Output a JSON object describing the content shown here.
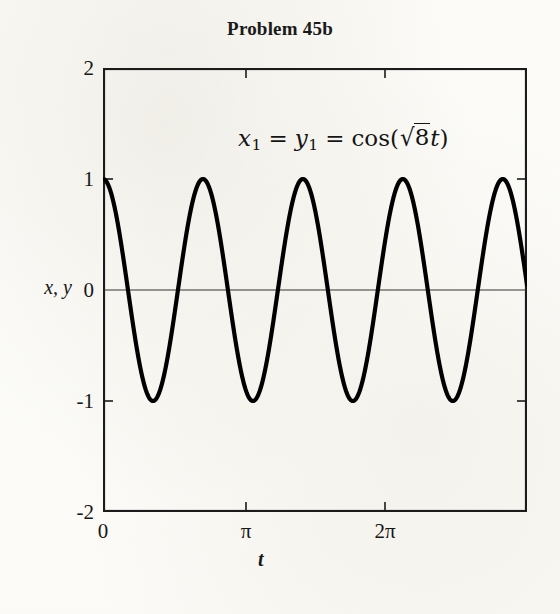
{
  "figure": {
    "title": "Problem 45b"
  },
  "annotation": {
    "lhs_var": "x",
    "lhs_sub": "1",
    "eq1": "=",
    "mid_var": "y",
    "mid_sub": "1",
    "eq2": "=",
    "func": "cos(",
    "radical": "√",
    "radicand": "8",
    "arg_var": "t",
    "close": ")",
    "full_text": "x₁ = y₁ = cos(√8t)"
  },
  "axes": {
    "ylabel": "x, y",
    "xlabel": "t",
    "yticks": [
      "2",
      "1",
      "0",
      "-1",
      "-2"
    ],
    "xticks": [
      "0",
      "π",
      "2π"
    ]
  },
  "chart_data": {
    "type": "line",
    "title": "Problem 45b",
    "xlabel": "t",
    "ylabel": "x, y",
    "xlim": [
      0,
      9.4248
    ],
    "ylim": [
      -2,
      2
    ],
    "xticks": [
      0,
      3.14159,
      6.28319
    ],
    "xticklabels": [
      "0",
      "π",
      "2π"
    ],
    "yticks": [
      -2,
      -1,
      0,
      1,
      2
    ],
    "yticklabels": [
      "-2",
      "-1",
      "0",
      "1",
      "2"
    ],
    "grid": false,
    "legend": null,
    "annotations": [
      {
        "text": "x_1 = y_1 = cos(sqrt(8) t)",
        "x": 4.2,
        "y": 1.45
      }
    ],
    "series": [
      {
        "name": "x1 = y1 = cos(sqrt(8) t)",
        "formula": "cos(2.8284271247461903 * t)",
        "color": "#000000",
        "linewidth": 4.2,
        "period": 2.221441469079183,
        "amplitude": 1,
        "x": [
          0,
          0.1924,
          0.3848,
          0.5772,
          0.7696,
          0.962,
          1.1544,
          1.3468,
          1.5392,
          1.7316,
          1.924,
          2.1164,
          2.3088,
          2.5012,
          2.6936,
          2.886,
          3.0784,
          3.2708,
          3.4632,
          3.6556,
          3.848,
          4.0404,
          4.2328,
          4.4252,
          4.6176,
          4.81,
          5.0024,
          5.1948,
          5.3872,
          5.5796,
          5.772,
          5.9644,
          6.1568,
          6.3492,
          6.5416,
          6.734,
          6.9264,
          7.1188,
          7.3112,
          7.5036,
          7.696,
          7.8884,
          8.0808,
          8.2732,
          8.4656,
          8.658,
          8.8504,
          9.0428,
          9.2352,
          9.4248
        ],
        "y": [
          1.0,
          0.853,
          0.455,
          -0.071,
          -0.568,
          -0.894,
          -0.97,
          -0.777,
          -0.368,
          0.142,
          0.617,
          0.919,
          0.96,
          0.743,
          0.315,
          -0.199,
          -0.663,
          -0.94,
          -0.949,
          -0.705,
          -0.261,
          0.254,
          0.705,
          0.957,
          0.935,
          0.663,
          0.206,
          -0.309,
          -0.743,
          -0.968,
          -0.918,
          -0.617,
          -0.149,
          0.364,
          0.777,
          0.975,
          0.897,
          0.569,
          0.092,
          -0.418,
          -0.809,
          -0.98,
          -0.872,
          -0.519,
          -0.035,
          0.47,
          0.838,
          0.983,
          0.845,
          0.153
        ]
      }
    ],
    "zero_line": {
      "y": 0,
      "color": "#333333",
      "linewidth": 1
    }
  }
}
